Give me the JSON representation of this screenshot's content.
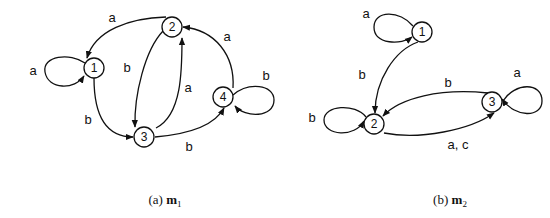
{
  "diagrams": [
    {
      "id": "m1",
      "caption": {
        "prefix": "(a) ",
        "name": "m",
        "subscript": "1"
      },
      "states": [
        {
          "id": "1",
          "label": "1"
        },
        {
          "id": "2",
          "label": "2"
        },
        {
          "id": "3",
          "label": "3"
        },
        {
          "id": "4",
          "label": "4"
        }
      ],
      "transitions": [
        {
          "from": "1",
          "to": "1",
          "label": "a"
        },
        {
          "from": "2",
          "to": "1",
          "label": "a"
        },
        {
          "from": "1",
          "to": "3",
          "label": "b"
        },
        {
          "from": "2",
          "to": "3",
          "label": "b"
        },
        {
          "from": "3",
          "to": "2",
          "label": "a"
        },
        {
          "from": "3",
          "to": "4",
          "label": "b"
        },
        {
          "from": "4",
          "to": "2",
          "label": "a"
        },
        {
          "from": "4",
          "to": "4",
          "label": "b"
        }
      ]
    },
    {
      "id": "m2",
      "caption": {
        "prefix": "(b) ",
        "name": "m",
        "subscript": "2"
      },
      "states": [
        {
          "id": "1",
          "label": "1"
        },
        {
          "id": "2",
          "label": "2"
        },
        {
          "id": "3",
          "label": "3"
        }
      ],
      "transitions": [
        {
          "from": "1",
          "to": "1",
          "label": "a"
        },
        {
          "from": "1",
          "to": "2",
          "label": "b"
        },
        {
          "from": "2",
          "to": "2",
          "label": "b"
        },
        {
          "from": "3",
          "to": "2",
          "label": "b"
        },
        {
          "from": "2",
          "to": "3",
          "label": "a, c"
        },
        {
          "from": "3",
          "to": "3",
          "label": "a"
        }
      ]
    }
  ]
}
